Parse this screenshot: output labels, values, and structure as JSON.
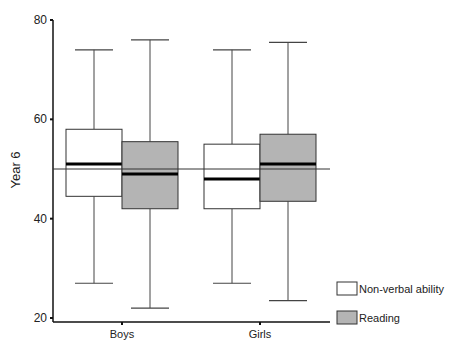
{
  "chart_data": {
    "type": "boxplot",
    "title": "",
    "xlabel": "",
    "ylabel": "Year 6",
    "ylim": [
      20,
      80
    ],
    "yticks": [
      20,
      40,
      60,
      80
    ],
    "categories": [
      "Boys",
      "Girls"
    ],
    "reference_line": 50,
    "grid": false,
    "legend_position": "bottom-right",
    "series": [
      {
        "name": "Non-verbal ability",
        "fill": "#ffffff",
        "boxes": [
          {
            "category": "Boys",
            "min": 27,
            "q1": 44.5,
            "median": 51,
            "q3": 58,
            "max": 74
          },
          {
            "category": "Girls",
            "min": 27,
            "q1": 42,
            "median": 48,
            "q3": 55,
            "max": 74
          }
        ]
      },
      {
        "name": "Reading",
        "fill": "#b4b4b4",
        "boxes": [
          {
            "category": "Boys",
            "min": 22,
            "q1": 42,
            "median": 49,
            "q3": 55.5,
            "max": 76
          },
          {
            "category": "Girls",
            "min": 23.5,
            "q1": 43.5,
            "median": 51,
            "q3": 57,
            "max": 75.5
          }
        ]
      }
    ]
  },
  "labels": {
    "ylabel": "Year 6",
    "yticks": [
      "20",
      "40",
      "60",
      "80"
    ],
    "categories": [
      "Boys",
      "Girls"
    ],
    "legend": [
      "Non-verbal ability",
      "Reading"
    ]
  }
}
